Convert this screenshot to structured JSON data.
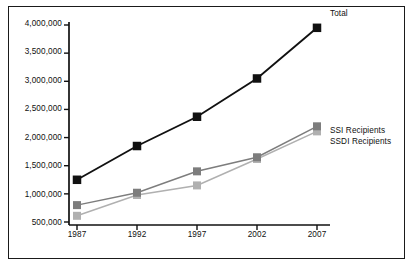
{
  "chart_data": {
    "type": "line",
    "title": "",
    "xlabel": "",
    "ylabel": "",
    "categories": [
      "1987",
      "1992",
      "1997",
      "2002",
      "2007"
    ],
    "x": [
      1987,
      1992,
      1997,
      2002,
      2007
    ],
    "xlim": [
      1985,
      2009
    ],
    "ylim": [
      500000,
      4000000
    ],
    "ytick_labels": [
      "500,000",
      "1,000,000",
      "1,500,000",
      "2,000,000",
      "2,500,000",
      "3,000,000",
      "3,500,000",
      "4,000,000"
    ],
    "ytick_values": [
      500000,
      1000000,
      1500000,
      2000000,
      2500000,
      3000000,
      3500000,
      4000000
    ],
    "grid": false,
    "legend_position": "inside-right",
    "series": [
      {
        "name": "Total",
        "label": "Total",
        "color": "#111111",
        "marker": "square",
        "values": [
          1250000,
          1850000,
          2370000,
          3050000,
          3950000
        ]
      },
      {
        "name": "SSI Recipients",
        "label": "SSI Recipients",
        "color": "#7d7d7d",
        "marker": "square",
        "values": [
          800000,
          1020000,
          1400000,
          1650000,
          2200000
        ]
      },
      {
        "name": "SSDI Recipients",
        "label": "SSDI Recipients",
        "color": "#b0b0b0",
        "marker": "square",
        "values": [
          610000,
          980000,
          1150000,
          1620000,
          2110000
        ]
      }
    ]
  },
  "axes": {
    "ytick_labels": [
      "4,000,000",
      "3,500,000",
      "3,000,000",
      "2,500,000",
      "2,000,000",
      "1,500,000",
      "1,000,000",
      "500,000"
    ],
    "xtick_labels": [
      "1987",
      "1992",
      "1997",
      "2002",
      "2007"
    ]
  },
  "legend": {
    "total": "Total",
    "ssi": "SSI Recipients",
    "ssdi": "SSDI Recipients"
  },
  "colors": {
    "total": "#111111",
    "ssi": "#7d7d7d",
    "ssdi": "#b0b0b0",
    "axis": "#111111",
    "frame": "#1a1a1a",
    "background": "#ffffff"
  }
}
